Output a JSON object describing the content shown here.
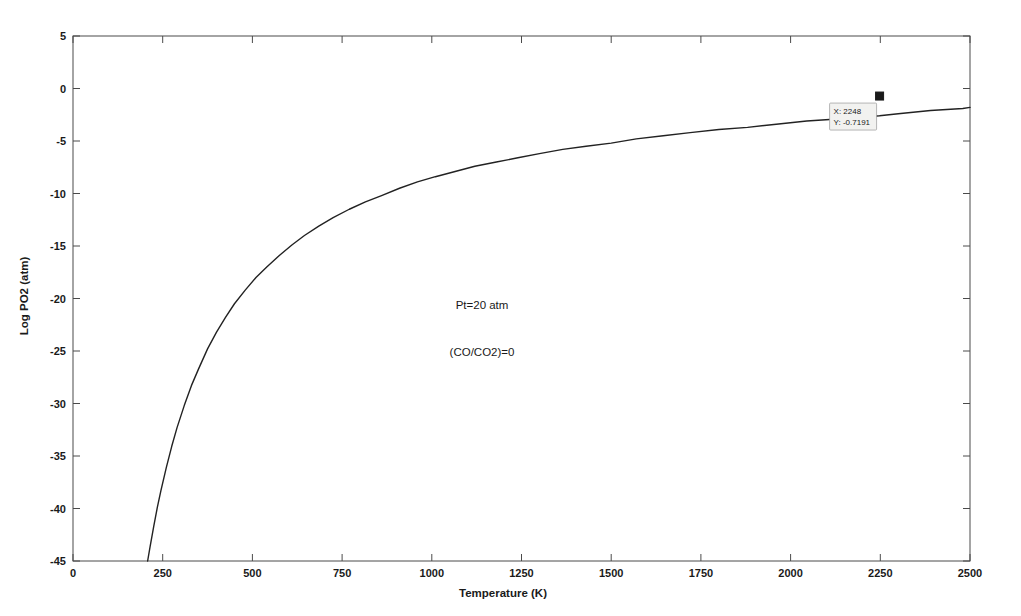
{
  "chart_data": {
    "type": "line",
    "title": "",
    "xlabel": "Temperature (K)",
    "ylabel": "Log PO2 (atm)",
    "xlim": [
      0,
      2500
    ],
    "ylim": [
      -45,
      5
    ],
    "xticks": [
      0,
      250,
      500,
      750,
      1000,
      1250,
      1500,
      1750,
      2000,
      2250,
      2500
    ],
    "xtick_labels": [
      "0",
      "250",
      "500",
      "750",
      "1000",
      "1250",
      "1500",
      "1750",
      "2000",
      "2250",
      "2500"
    ],
    "yticks": [
      5,
      0,
      -5,
      -10,
      -15,
      -20,
      -25,
      -30,
      -35,
      -40,
      -45
    ],
    "ytick_labels": [
      "5",
      "0",
      "-5",
      "-10",
      "-15",
      "-20",
      "-25",
      "-30",
      "-35",
      "-40",
      "-45"
    ],
    "grid": false,
    "legend": null,
    "series": [
      {
        "name": "Log PO2",
        "color": "#222222",
        "x": [
          208,
          215,
          225,
          235,
          245,
          260,
          275,
          290,
          310,
          330,
          350,
          375,
          400,
          425,
          450,
          480,
          510,
          540,
          575,
          610,
          645,
          685,
          725,
          770,
          815,
          860,
          910,
          960,
          1010,
          1065,
          1120,
          1180,
          1240,
          1300,
          1365,
          1430,
          1500,
          1570,
          1645,
          1720,
          1800,
          1880,
          1960,
          2045,
          2130,
          2215,
          2248,
          2300,
          2390,
          2480,
          2500
        ],
        "y": [
          -45.0,
          -43.6,
          -41.7,
          -39.9,
          -38.3,
          -36.1,
          -34.1,
          -32.3,
          -30.2,
          -28.3,
          -26.7,
          -24.8,
          -23.2,
          -21.8,
          -20.5,
          -19.2,
          -18.0,
          -17.0,
          -15.9,
          -14.9,
          -14.0,
          -13.1,
          -12.3,
          -11.5,
          -10.8,
          -10.2,
          -9.5,
          -8.9,
          -8.4,
          -7.9,
          -7.4,
          -7.0,
          -6.6,
          -6.2,
          -5.8,
          -5.5,
          -5.2,
          -4.8,
          -4.5,
          -4.2,
          -3.9,
          -3.7,
          -3.4,
          -3.1,
          -2.9,
          -2.7,
          -2.6,
          -2.4,
          -2.1,
          -1.9,
          -1.8
        ]
      }
    ],
    "annotations": [
      {
        "text": "Pt=20 atm",
        "x": 1140,
        "y": -21.0
      },
      {
        "text": "(CO/CO2)=0",
        "x": 1140,
        "y": -25.5
      }
    ],
    "data_tip": {
      "x_label": "X: 2248",
      "y_label": "Y: -0.7191",
      "x_value": 2248,
      "y_value": -0.7191
    }
  },
  "colors": {
    "curve": "#222222",
    "axis": "#4a4a4a",
    "text": "#1a1a1a",
    "tip_background": "#f2f2f0",
    "tip_border": "#9a9a9a",
    "figure_background": "#ffffff"
  }
}
